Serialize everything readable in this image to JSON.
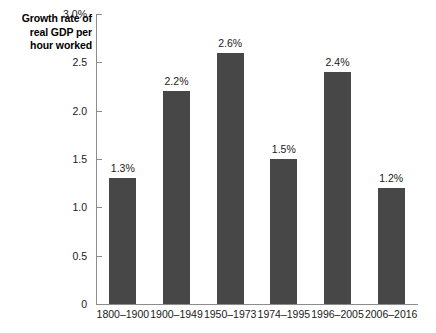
{
  "chart_data": {
    "type": "bar",
    "title": "Growth rate of real GDP per hour worked",
    "title_lines": [
      "Growth rate of",
      "real GDP per",
      "hour worked"
    ],
    "xlabel": "",
    "ylabel": "",
    "ylim": [
      0,
      3.0
    ],
    "ytick_values": [
      0,
      0.5,
      1.0,
      1.5,
      2.0,
      2.5,
      3.0
    ],
    "ytick_labels": [
      "0",
      "0.5",
      "1.0",
      "1.5",
      "2.0",
      "2.5",
      "3.0%"
    ],
    "grid": false,
    "legend": false,
    "bar_color": "#474747",
    "axis_color": "#8c8c8c",
    "categories": [
      "1800–1900",
      "1900–1949",
      "1950–1973",
      "1974–1995",
      "1996–2005",
      "2006–2016"
    ],
    "values": [
      1.3,
      2.2,
      2.6,
      1.5,
      2.4,
      1.2
    ],
    "value_labels": [
      "1.3%",
      "2.2%",
      "2.6%",
      "1.5%",
      "2.4%",
      "1.2%"
    ]
  }
}
